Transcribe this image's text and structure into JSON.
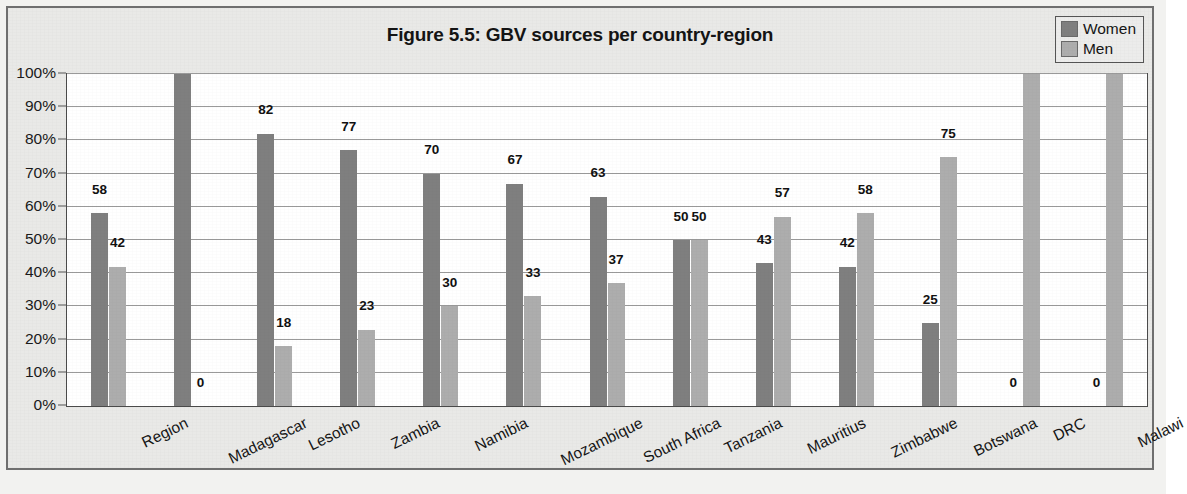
{
  "chart_title": "Figure 5.5: GBV sources per country-region",
  "legend": {
    "position": "top-right",
    "items": [
      {
        "label": "Women",
        "color": "#7f7f7f"
      },
      {
        "label": "Men",
        "color": "#adadad"
      }
    ]
  },
  "axis": {
    "y_ticks": [
      "0%",
      "10%",
      "20%",
      "30%",
      "40%",
      "50%",
      "60%",
      "70%",
      "80%",
      "90%",
      "100%"
    ]
  },
  "chart_data": {
    "type": "bar",
    "title": "Figure 5.5: GBV sources per country-region",
    "xlabel": "",
    "ylabel": "",
    "ylim": [
      0,
      100
    ],
    "ytick_labels": [
      "0%",
      "10%",
      "20%",
      "30%",
      "40%",
      "50%",
      "60%",
      "70%",
      "80%",
      "90%",
      "100%"
    ],
    "grid": true,
    "legend_position": "top-right",
    "categories": [
      "Region",
      "Madagascar",
      "Lesotho",
      "Zambia",
      "Namibia",
      "Mozambique",
      "South Africa",
      "Tanzania",
      "Mauritius",
      "Zimbabwe",
      "Botswana",
      "DRC",
      "Malawi"
    ],
    "series": [
      {
        "name": "Women",
        "color": "#7f7f7f",
        "values": [
          58,
          100,
          82,
          77,
          70,
          67,
          63,
          50,
          43,
          42,
          25,
          0,
          0
        ],
        "labels": [
          "58",
          "",
          "82",
          "77",
          "70",
          "67",
          "63",
          "50",
          "43",
          "42",
          "25",
          "0",
          "0"
        ]
      },
      {
        "name": "Men",
        "color": "#adadad",
        "values": [
          42,
          0,
          18,
          23,
          30,
          33,
          37,
          50,
          57,
          58,
          75,
          100,
          100
        ],
        "labels": [
          "42",
          "0",
          "18",
          "23",
          "30",
          "33",
          "37",
          "50",
          "57",
          "58",
          "75",
          "",
          ""
        ]
      }
    ]
  }
}
